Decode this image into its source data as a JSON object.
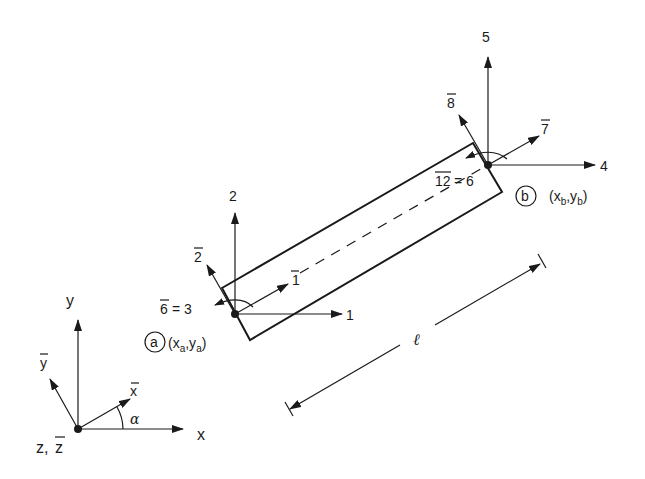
{
  "figure": {
    "global_axes": {
      "x_label": "x",
      "y_label": "y",
      "z_label": "z,",
      "zbar_label": "z",
      "xbar_label": "x",
      "ybar_label": "y",
      "angle_label": "α"
    },
    "node_a": {
      "circle_label": "a",
      "coord_open": "(x",
      "coord_sub1": "a",
      "coord_mid": ",y",
      "coord_sub2": "a",
      "coord_close": ")",
      "dof_x": "1",
      "dof_y": "2",
      "dof_ybar": "2",
      "dof_xbar": "1",
      "dof_rot": "6",
      "dof_rot_eq": "= 3"
    },
    "node_b": {
      "circle_label": "b",
      "coord_open": "(x",
      "coord_sub1": "b",
      "coord_mid": ",y",
      "coord_sub2": "b",
      "coord_close": ")",
      "dof_x": "4",
      "dof_y": "5",
      "dof_ybar": "8",
      "dof_xbar": "7",
      "dof_rot": "12",
      "dof_rot_eq": "= 6"
    },
    "length_label": "ℓ"
  },
  "colors": {
    "ink": "#1a1a1a",
    "background": "#ffffff"
  }
}
